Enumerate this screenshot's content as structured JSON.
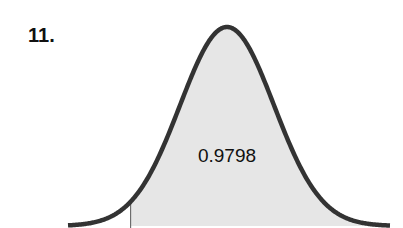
{
  "problem": {
    "number": "11."
  },
  "chart_data": {
    "type": "area",
    "title": "",
    "distribution": "standard normal",
    "shaded_region": "right of z ≈ -2.05",
    "shaded_area_label": "0.9798",
    "z_cutoff": -2.05,
    "xlabel": "",
    "ylabel": "",
    "grid": false,
    "legend": null,
    "colors": {
      "curve": "#333333",
      "fill": "#e6e6e6",
      "cutoff_line": "#555555"
    }
  }
}
